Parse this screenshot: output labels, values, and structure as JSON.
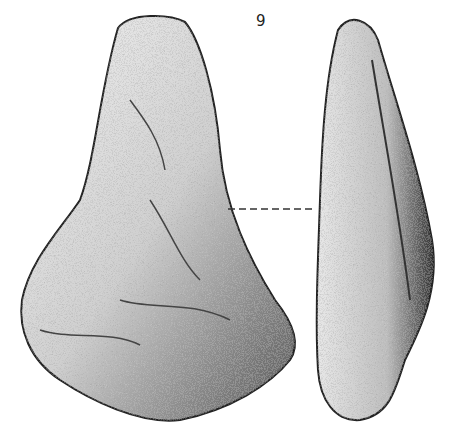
{
  "figure": {
    "number_label": "9",
    "views": [
      {
        "name": "face-view"
      },
      {
        "name": "profile-view"
      }
    ],
    "connector": "dashed line"
  }
}
